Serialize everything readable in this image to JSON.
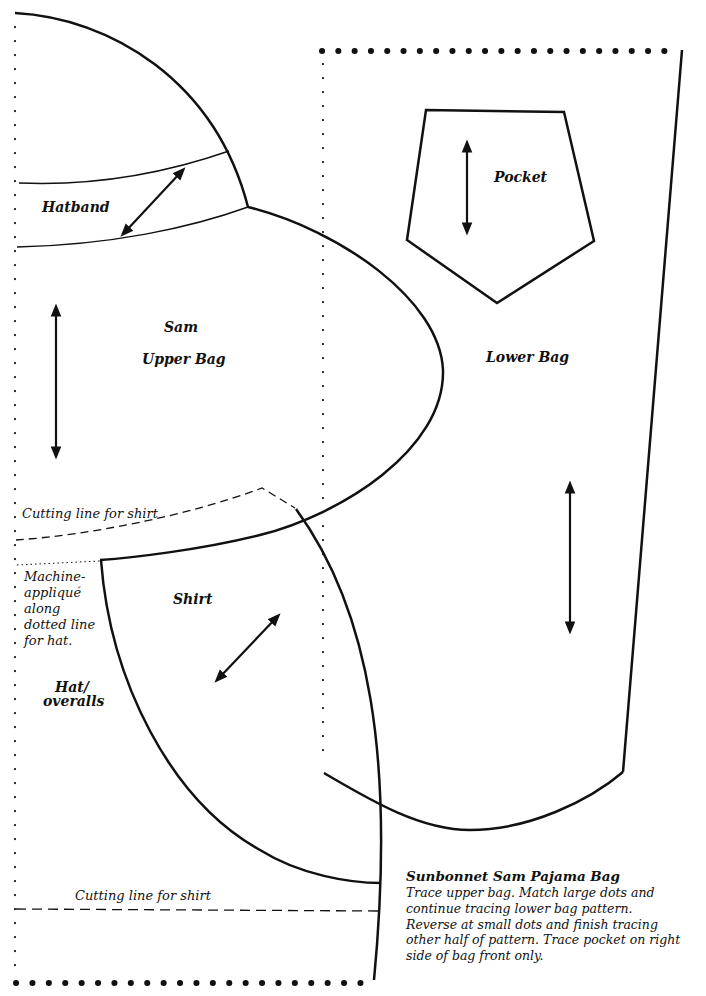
{
  "pattern": {
    "title": "Sunbonnet Sam Pajama Bag",
    "pieces": {
      "hatband": "Hatband",
      "upper_bag_line1": "Sam",
      "upper_bag_line2": "Upper Bag",
      "pocket": "Pocket",
      "lower_bag": "Lower Bag",
      "shirt": "Shirt",
      "hat_overalls_line1": "Hat/",
      "hat_overalls_line2": "overalls"
    },
    "notes": {
      "cutting_line_upper": "Cutting line for shirt",
      "cutting_line_lower": "Cutting line for shirt",
      "applique": [
        "Machine-",
        "appliqué",
        "along",
        "dotted line",
        "for hat."
      ]
    },
    "instructions": {
      "heading": "Sunbonnet Sam Pajama Bag",
      "lines": [
        "Trace upper bag. Match large dots and",
        "continue tracing lower bag pattern.",
        "Reverse at small dots and finish tracing",
        "other half of pattern. Trace pocket on right",
        "side of bag front only."
      ]
    },
    "icons": {
      "grainline_arrows": [
        "hatband-grainline-arrow",
        "upper-bag-grainline-arrow",
        "pocket-grainline-arrow",
        "lower-bag-grainline-arrow",
        "shirt-grainline-arrow"
      ],
      "large_dots": "match-point-large-dots",
      "small_dots": "fold-line-small-dots"
    },
    "colors": {
      "line": "#111111",
      "background": "#ffffff"
    }
  }
}
